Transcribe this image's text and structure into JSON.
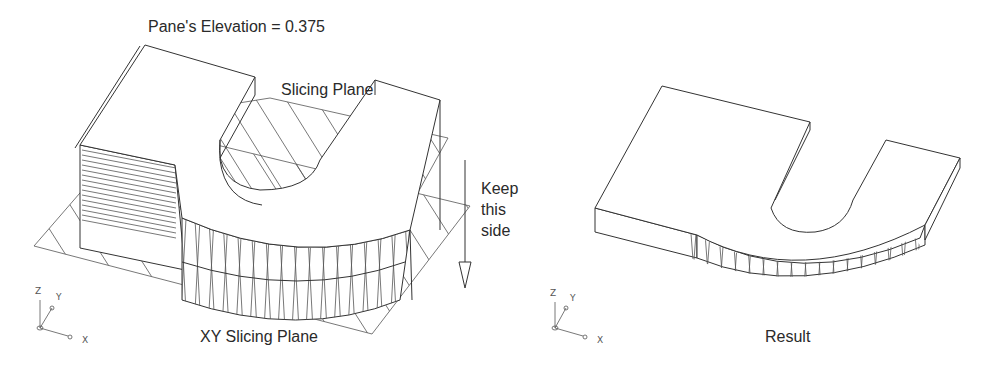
{
  "left_figure": {
    "title": "Pane's Elevation = 0.375",
    "slicing_plane_label": "Slicing Plane",
    "keep_label_lines": [
      "Keep",
      "this",
      "side"
    ],
    "xy_plane_label": "XY Slicing Plane",
    "axis_labels": {
      "x": "X",
      "y": "Y",
      "z": "Z"
    }
  },
  "right_figure": {
    "caption": "Result",
    "axis_labels": {
      "x": "X",
      "y": "Y",
      "z": "Z"
    }
  }
}
